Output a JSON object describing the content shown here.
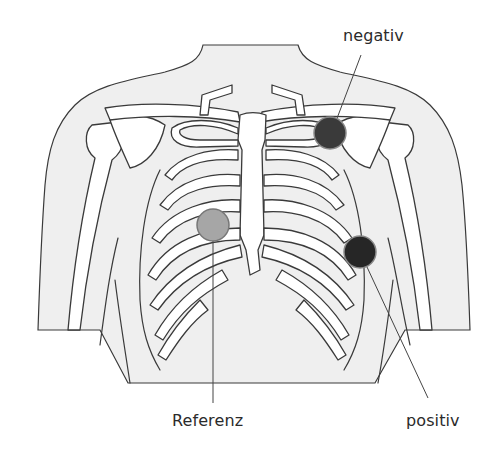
{
  "figure": {
    "background": "#ffffff",
    "body_fill": "#efefef",
    "bone_fill": "#ffffff",
    "outline_color": "#3a3a3a"
  },
  "electrodes": [
    {
      "id": "negativ",
      "label": "negativ",
      "fill": "#3a3a3a",
      "cx": 330,
      "cy": 133,
      "r": 16
    },
    {
      "id": "referenz",
      "label": "Referenz",
      "fill": "#a6a6a6",
      "cx": 213,
      "cy": 225,
      "r": 16
    },
    {
      "id": "positiv",
      "label": "positiv",
      "fill": "#262626",
      "cx": 360,
      "cy": 252,
      "r": 16
    }
  ],
  "labels": {
    "negativ": "negativ",
    "referenz": "Referenz",
    "positiv": "positiv"
  }
}
